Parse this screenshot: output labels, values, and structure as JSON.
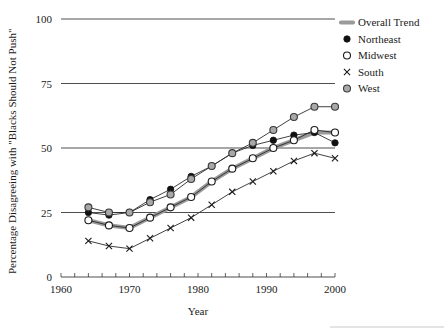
{
  "chart_data": {
    "type": "line",
    "title": "",
    "xlabel": "Year",
    "ylabel": "Percentage Disagreeing with \"Blacks Should Not Push\"",
    "xlim": [
      1960,
      2000
    ],
    "ylim": [
      0,
      100
    ],
    "xticks": [
      1960,
      1970,
      1980,
      1990,
      2000
    ],
    "xtick_labels": [
      "1960",
      "1970",
      "1980",
      "1990",
      "2000"
    ],
    "yticks": [
      0,
      25,
      50,
      75,
      100
    ],
    "ytick_labels": [
      "0",
      "25",
      "50",
      "75",
      "100"
    ],
    "grid": "horizontal",
    "minor_xtick_interval": 2,
    "legend_position": "top-right",
    "x": [
      1964,
      1967,
      1970,
      1973,
      1976,
      1979,
      1982,
      1985,
      1988,
      1991,
      1994,
      1997,
      2000
    ],
    "series": [
      {
        "name": "Overall Trend",
        "marker": "thick-line",
        "color": "#9a9a9a",
        "values": [
          22,
          20,
          19,
          23,
          27,
          31,
          37,
          42,
          46,
          50,
          53,
          56,
          56
        ]
      },
      {
        "name": "Northeast",
        "marker": "filled-circle",
        "color": "#111111",
        "values": [
          25,
          24,
          25,
          30,
          34,
          39,
          43,
          48,
          51,
          53,
          55,
          56,
          52
        ]
      },
      {
        "name": "Midwest",
        "marker": "open-circle",
        "color": "#ffffff",
        "values": [
          22,
          20,
          19,
          23,
          27,
          31,
          37,
          42,
          46,
          50,
          53,
          57,
          56
        ]
      },
      {
        "name": "South",
        "marker": "cross",
        "color": "#1a1a1a",
        "values": [
          14,
          12,
          11,
          15,
          19,
          23,
          28,
          33,
          37,
          41,
          45,
          48,
          46
        ]
      },
      {
        "name": "West",
        "marker": "gray-circle",
        "color": "#a8a8a8",
        "values": [
          27,
          25,
          25,
          29,
          32,
          38,
          43,
          48,
          52,
          57,
          62,
          66,
          66
        ]
      }
    ]
  },
  "legend": {
    "items": [
      {
        "label": "Overall Trend",
        "marker": "thick-line"
      },
      {
        "label": "Northeast",
        "marker": "filled-circle"
      },
      {
        "label": "Midwest",
        "marker": "open-circle"
      },
      {
        "label": "South",
        "marker": "cross"
      },
      {
        "label": "West",
        "marker": "gray-circle"
      }
    ]
  },
  "axes": {
    "x_title": "Year",
    "y_title": "Percentage Disagreeing with \"Blacks Should Not Push\"",
    "x_tick_0": "1960",
    "x_tick_1": "1970",
    "x_tick_2": "1980",
    "x_tick_3": "1990",
    "x_tick_4": "2000",
    "y_tick_0": "0",
    "y_tick_1": "25",
    "y_tick_2": "50",
    "y_tick_3": "75",
    "y_tick_4": "100"
  }
}
